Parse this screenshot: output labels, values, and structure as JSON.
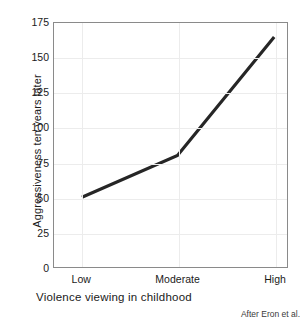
{
  "chart_data": {
    "type": "line",
    "title": "",
    "subtitle": "",
    "xlabel": "Violence viewing in childhood",
    "ylabel": "Aggressiveness ten years later",
    "categories": [
      "Low",
      "Moderate",
      "High"
    ],
    "values": [
      50,
      80,
      165
    ],
    "series": [
      {
        "name": "Aggressiveness ten years later",
        "values": [
          50,
          80,
          165
        ]
      }
    ],
    "ylim": [
      0,
      175
    ],
    "yticks": [
      0,
      25,
      50,
      75,
      100,
      125,
      150,
      175
    ],
    "ytick_labels": [
      "0",
      "25",
      "50",
      "75",
      "100",
      "125",
      "150",
      "175"
    ],
    "xtick_labels": [
      "Low",
      "Moderate",
      "High"
    ],
    "grid": true,
    "grid_axes": "both",
    "legend": false,
    "legend_position": "none",
    "annotations": [
      "After Eron et al."
    ],
    "line_color": "#262626",
    "grid_color": "#ececec",
    "axis_color": "#8a8a8a",
    "background_color": "#ffffff"
  },
  "figure": {
    "source_note": "After Eron et al."
  }
}
